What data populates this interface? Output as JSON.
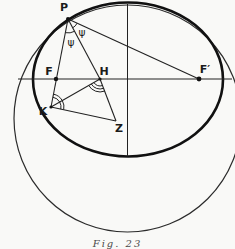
{
  "diagram": {
    "points": {
      "P": "P",
      "F": "F",
      "H": "H",
      "F_prime": "F′",
      "K": "K",
      "Z": "Z"
    },
    "angle_labels": {
      "psi_between_PH_PFprime": "ψ",
      "psi_between_PK_PH": "ψ"
    },
    "caption": "Fig. 23",
    "colors": {
      "ink": "#1b1b1b",
      "ellipse_stroke": "#111111",
      "circle_stroke": "#2b2b2b",
      "paper": "#f9f9f7"
    }
  }
}
